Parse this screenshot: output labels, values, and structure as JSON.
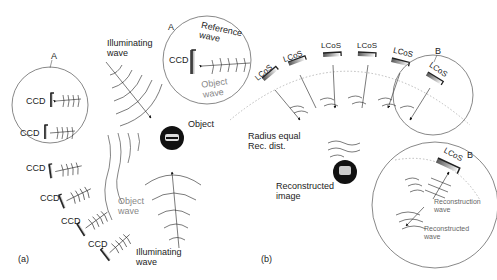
{
  "panel_a": {
    "label": "(a)",
    "circle_label": "A",
    "ccd_label": "CCD",
    "illuminating_wave_top": [
      "Illuminating",
      "wave"
    ],
    "illuminating_wave_bottom": [
      "Illuminating",
      "wave"
    ],
    "object_label": "Object",
    "object_wave": [
      "Object",
      "wave"
    ],
    "inset": {
      "label": "A",
      "ccd": "CCD",
      "reference_wave": [
        "Reference",
        "wave"
      ],
      "object_wave": [
        "Object",
        "wave"
      ]
    }
  },
  "panel_b": {
    "label": "(b)",
    "lcos_label": "LCoS",
    "circle_label": "B",
    "radius_note": [
      "Radius equal",
      "Rec. dist."
    ],
    "reconstructed_image": [
      "Reconstructed",
      "image"
    ],
    "inset": {
      "label": "B",
      "lcos": "LCoS",
      "reconstruction_wave": [
        "Reconstruction",
        "wave"
      ],
      "reconstructed_wave": [
        "Reconstructed",
        "wave"
      ]
    }
  }
}
